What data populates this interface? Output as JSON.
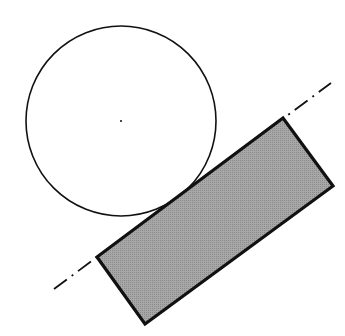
{
  "diagram": {
    "elements": [
      {
        "type": "circle",
        "name": "disc",
        "center": [
          121,
          121
        ],
        "radius": 95,
        "stroke": "#111111",
        "fill": "#ffffff"
      },
      {
        "type": "point",
        "name": "circle-center",
        "at": [
          121,
          121
        ]
      },
      {
        "type": "polygon",
        "name": "block",
        "points": [
          [
            97,
            257
          ],
          [
            283,
            118
          ],
          [
            333,
            186
          ],
          [
            145,
            324
          ]
        ],
        "fill": "#9a9a9a",
        "stroke": "#111111"
      },
      {
        "type": "line",
        "name": "center-line",
        "from": [
          54,
          289
        ],
        "to": [
          331,
          83
        ],
        "style": "dash-dot",
        "stroke": "#111111"
      }
    ],
    "colors": {
      "stroke": "#111111",
      "fill": "#9a9a9a",
      "background": "#ffffff"
    }
  }
}
